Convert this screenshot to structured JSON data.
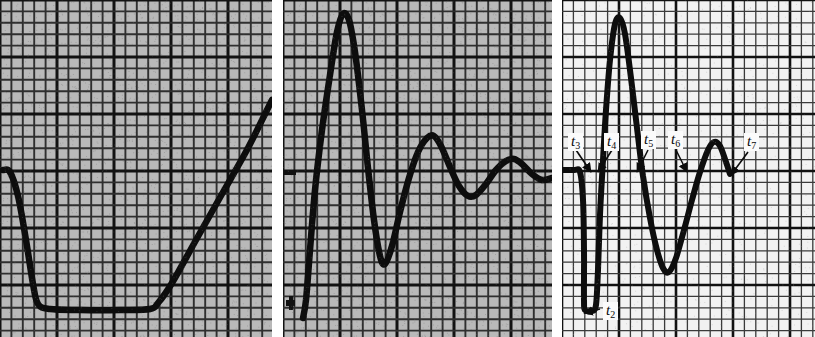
{
  "figure": {
    "kind": "oscillograph-traces",
    "panel_count": 3,
    "background_tinted": "#b9b9b9",
    "background_white": "#f2f2f2",
    "trace_color": "#101010",
    "grid_color": "#2a2a2a"
  },
  "panels": [
    {
      "id": "panel-a",
      "name": "left-trace-panel",
      "tint": "tinted",
      "grid": {
        "minor": 11.4,
        "major": 5,
        "show_major": true
      },
      "labels": []
    },
    {
      "id": "panel-b",
      "name": "middle-trace-panel",
      "tint": "tinted",
      "grid": {
        "minor": 11.4,
        "major": 5,
        "show_major": true
      },
      "labels": []
    },
    {
      "id": "panel-c",
      "name": "right-trace-panel",
      "tint": "white",
      "grid": {
        "minor": 11.4,
        "major": 5,
        "show_major": true
      },
      "labels": [
        {
          "key": "t3",
          "text": "t",
          "sub": "3",
          "x": 568,
          "y": 133
        },
        {
          "key": "t4",
          "text": "t",
          "sub": "4",
          "x": 604,
          "y": 133
        },
        {
          "key": "t5",
          "text": "t",
          "sub": "5",
          "x": 641,
          "y": 131
        },
        {
          "key": "t6",
          "text": "t",
          "sub": "6",
          "x": 668,
          "y": 131
        },
        {
          "key": "t7",
          "text": "t",
          "sub": "7",
          "x": 744,
          "y": 133
        },
        {
          "key": "t2",
          "text": "t",
          "sub": "2",
          "x": 603,
          "y": 302
        }
      ]
    }
  ],
  "chart_data": [
    {
      "type": "line",
      "name": "left-trace",
      "title": "",
      "xlabel": "",
      "ylabel": "",
      "xlim": [
        0,
        272
      ],
      "ylim": [
        337,
        0
      ],
      "grid": true,
      "points": [
        [
          3,
          170
        ],
        [
          10,
          172
        ],
        [
          18,
          196
        ],
        [
          26,
          240
        ],
        [
          33,
          284
        ],
        [
          38,
          304
        ],
        [
          50,
          309
        ],
        [
          80,
          310
        ],
        [
          120,
          310
        ],
        [
          150,
          309
        ],
        [
          158,
          303
        ],
        [
          172,
          283
        ],
        [
          196,
          240
        ],
        [
          222,
          194
        ],
        [
          248,
          148
        ],
        [
          266,
          112
        ],
        [
          272,
          100
        ]
      ]
    },
    {
      "type": "line",
      "name": "middle-trace",
      "title": "",
      "xlabel": "",
      "ylabel": "",
      "xlim": [
        283,
        552
      ],
      "ylim": [
        337,
        0
      ],
      "grid": true,
      "points": [
        [
          303,
          318
        ],
        [
          306,
          300
        ],
        [
          310,
          250
        ],
        [
          315,
          190
        ],
        [
          322,
          130
        ],
        [
          330,
          75
        ],
        [
          337,
          32
        ],
        [
          343,
          14
        ],
        [
          349,
          20
        ],
        [
          355,
          52
        ],
        [
          362,
          110
        ],
        [
          368,
          168
        ],
        [
          374,
          220
        ],
        [
          380,
          256
        ],
        [
          385,
          264
        ],
        [
          392,
          246
        ],
        [
          400,
          212
        ],
        [
          409,
          178
        ],
        [
          418,
          152
        ],
        [
          427,
          138
        ],
        [
          434,
          136
        ],
        [
          441,
          146
        ],
        [
          450,
          167
        ],
        [
          459,
          186
        ],
        [
          468,
          196
        ],
        [
          476,
          195
        ],
        [
          486,
          184
        ],
        [
          496,
          170
        ],
        [
          506,
          161
        ],
        [
          514,
          159
        ],
        [
          522,
          164
        ],
        [
          532,
          174
        ],
        [
          542,
          180
        ],
        [
          552,
          178
        ]
      ]
    },
    {
      "type": "line",
      "name": "right-trace",
      "title": "",
      "xlabel": "",
      "ylabel": "",
      "xlim": [
        562,
        815
      ],
      "ylim": [
        337,
        0
      ],
      "grid": true,
      "points": [
        [
          562,
          170
        ],
        [
          574,
          170
        ],
        [
          580,
          172
        ],
        [
          583,
          200
        ],
        [
          584,
          250
        ],
        [
          584,
          300
        ],
        [
          585,
          310
        ],
        [
          592,
          311
        ],
        [
          596,
          305
        ],
        [
          598,
          270
        ],
        [
          600,
          215
        ],
        [
          603,
          160
        ],
        [
          606,
          110
        ],
        [
          610,
          60
        ],
        [
          615,
          24
        ],
        [
          620,
          18
        ],
        [
          625,
          34
        ],
        [
          631,
          78
        ],
        [
          637,
          128
        ],
        [
          643,
          176
        ],
        [
          650,
          218
        ],
        [
          657,
          250
        ],
        [
          663,
          268
        ],
        [
          669,
          272
        ],
        [
          676,
          258
        ],
        [
          684,
          230
        ],
        [
          692,
          200
        ],
        [
          700,
          172
        ],
        [
          708,
          150
        ],
        [
          714,
          142
        ],
        [
          720,
          146
        ],
        [
          726,
          162
        ],
        [
          730,
          174
        ]
      ]
    }
  ],
  "annotations": {
    "arrows": [
      {
        "name": "arrow-t3",
        "from": [
          576,
          150
        ],
        "to": [
          591,
          172
        ]
      },
      {
        "name": "arrow-t4",
        "from": [
          612,
          150
        ],
        "to": [
          598,
          172
        ]
      },
      {
        "name": "arrow-t5",
        "from": [
          648,
          150
        ],
        "to": [
          637,
          172
        ]
      },
      {
        "name": "arrow-t6",
        "from": [
          676,
          150
        ],
        "to": [
          687,
          172
        ]
      },
      {
        "name": "arrow-t7",
        "from": [
          748,
          152
        ],
        "to": [
          731,
          175
        ]
      },
      {
        "name": "arrow-t2",
        "from": [
          600,
          309
        ],
        "to": [
          584,
          313
        ]
      }
    ]
  }
}
